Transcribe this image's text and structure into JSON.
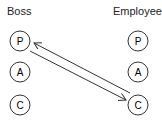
{
  "diagram": {
    "columns": [
      {
        "label": "Boss",
        "nodes": [
          "P",
          "A",
          "C"
        ]
      },
      {
        "label": "Employee",
        "nodes": [
          "P",
          "A",
          "C"
        ]
      }
    ],
    "arrows": [
      {
        "from": "Boss.P",
        "to": "Employee.C"
      },
      {
        "from": "Employee.C",
        "to": "Boss.P"
      }
    ],
    "colors": {
      "stroke": "#333333",
      "background": "#ffffff"
    }
  }
}
